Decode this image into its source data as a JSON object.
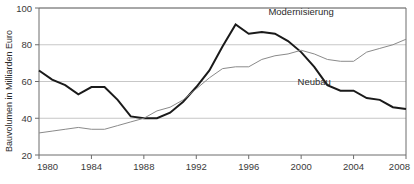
{
  "chart_data": {
    "type": "line",
    "title": "",
    "xlabel": "",
    "ylabel": "Bauvolumen in Milliarden Euro",
    "ylim": [
      20,
      100
    ],
    "xlim": [
      1980,
      2008
    ],
    "grid": true,
    "legend_position": "inline-annotation",
    "ytick_labels": [
      "100",
      "80",
      "60",
      "40",
      "20"
    ],
    "ytick_values": [
      100,
      80,
      60,
      40,
      20
    ],
    "xtick_labels": [
      "1980",
      "1984",
      "1988",
      "1992",
      "1996",
      "2000",
      "2004",
      "2008"
    ],
    "xtick_values": [
      1980,
      1984,
      1988,
      1992,
      1996,
      2000,
      2004,
      2008
    ],
    "x": [
      1980,
      1981,
      1982,
      1983,
      1984,
      1985,
      1986,
      1987,
      1988,
      1989,
      1990,
      1991,
      1992,
      1993,
      1994,
      1995,
      1996,
      1997,
      1998,
      1999,
      2000,
      2001,
      2002,
      2003,
      2004,
      2005,
      2006,
      2007,
      2008
    ],
    "series": [
      {
        "name": "Neubau",
        "color": "#1a1a1a",
        "values": [
          66,
          61,
          58,
          53,
          57,
          57,
          50,
          41,
          40,
          40,
          43,
          49,
          57,
          66,
          79,
          91,
          86,
          87,
          86,
          82,
          76,
          68,
          58,
          55,
          55,
          51,
          50,
          46,
          45
        ]
      },
      {
        "name": "Modernisierung",
        "color": "#8a8a8a",
        "values": [
          32,
          33,
          34,
          35,
          34,
          34,
          36,
          38,
          40,
          44,
          46,
          50,
          56,
          62,
          67,
          68,
          68,
          72,
          74,
          75,
          77,
          75,
          72,
          71,
          71,
          76,
          78,
          80,
          83
        ]
      }
    ],
    "annotations": [
      {
        "text": "Modernisierung",
        "x": 2000,
        "y": 96
      },
      {
        "text": "Neubau",
        "x": 2001,
        "y": 58
      }
    ]
  }
}
